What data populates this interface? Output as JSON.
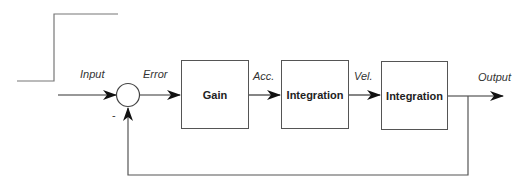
{
  "diagram": {
    "type": "control-loop block diagram",
    "signals": {
      "input": "Input",
      "error": "Error",
      "acc": "Acc.",
      "vel": "Vel.",
      "output": "Output",
      "minus_sign": "-"
    },
    "blocks": [
      {
        "id": "gain",
        "label": "Gain"
      },
      {
        "id": "integration1",
        "label": "Integration"
      },
      {
        "id": "integration2",
        "label": "Integration"
      }
    ],
    "line_color": "#555555"
  }
}
